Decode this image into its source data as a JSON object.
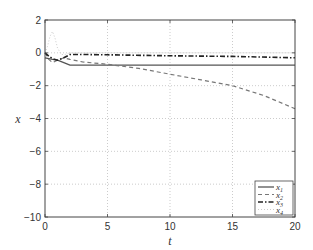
{
  "chart_data": {
    "type": "line",
    "title": "",
    "xlabel": "t",
    "ylabel": "x",
    "xlim": [
      0,
      20
    ],
    "ylim": [
      -10,
      2
    ],
    "xticks": [
      0,
      5,
      10,
      15,
      20
    ],
    "yticks": [
      2,
      0,
      -2,
      -4,
      -6,
      -8,
      -10
    ],
    "xtick_labels": [
      "0",
      "5",
      "10",
      "15",
      "20"
    ],
    "ytick_labels": [
      "2",
      "0",
      "−2",
      "−4",
      "−6",
      "−8",
      "−10"
    ],
    "grid": true,
    "legend_position": "lower right",
    "series": [
      {
        "name": "x1",
        "label": "x",
        "sub": "1",
        "style": "solid",
        "color": "#555555",
        "x": [
          0,
          0.3,
          0.6,
          1.0,
          1.5,
          2.0,
          3,
          5,
          10,
          15,
          20
        ],
        "y": [
          -0.3,
          -0.35,
          -0.4,
          -0.45,
          -0.6,
          -0.75,
          -0.75,
          -0.75,
          -0.75,
          -0.75,
          -0.75
        ]
      },
      {
        "name": "x2",
        "label": "x",
        "sub": "2",
        "style": "dashed",
        "color": "#777777",
        "x": [
          0,
          0.3,
          0.6,
          1.0,
          1.5,
          2.0,
          3,
          5,
          7.5,
          10,
          12.5,
          15,
          17.5,
          20
        ],
        "y": [
          0.0,
          -0.4,
          -0.6,
          -0.45,
          -0.3,
          -0.4,
          -0.55,
          -0.7,
          -0.95,
          -1.3,
          -1.65,
          -2.0,
          -2.6,
          -3.4
        ]
      },
      {
        "name": "x3",
        "label": "x",
        "sub": "3",
        "style": "dashdot",
        "color": "#222222",
        "x": [
          0,
          0.3,
          0.6,
          1.0,
          1.5,
          2.0,
          3,
          5,
          10,
          15,
          20
        ],
        "y": [
          0.0,
          -0.2,
          -0.35,
          -0.45,
          -0.3,
          -0.1,
          -0.1,
          -0.12,
          -0.18,
          -0.22,
          -0.3
        ]
      },
      {
        "name": "x4",
        "label": "x",
        "sub": "4",
        "style": "dotted",
        "color": "#cccccc",
        "x": [
          0,
          0.2,
          0.4,
          0.6,
          0.8,
          1.0,
          1.3,
          1.6,
          2.0,
          3,
          5,
          10,
          15,
          20
        ],
        "y": [
          0.0,
          0.4,
          1.0,
          1.3,
          0.9,
          0.3,
          -0.1,
          -0.1,
          0.0,
          0.0,
          0.0,
          0.0,
          0.0,
          0.0
        ]
      }
    ]
  },
  "colors": {
    "axes": "#444444",
    "grid": "#aaaaaa",
    "background": "#ffffff"
  }
}
